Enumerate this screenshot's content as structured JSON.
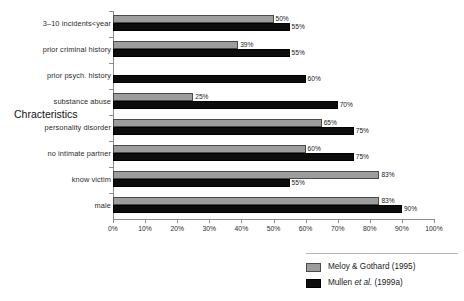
{
  "chart_data": {
    "type": "bar",
    "orientation": "horizontal",
    "title": "",
    "xlabel": "",
    "ylabel": "Chracteristics",
    "xlim": [
      0,
      100
    ],
    "grid": false,
    "legend_position": "bottom-right",
    "x_tick_labels": [
      "0%",
      "10%",
      "20%",
      "30%",
      "40%",
      "50%",
      "60%",
      "70%",
      "80%",
      "90%",
      "100%"
    ],
    "x_ticks": [
      0,
      10,
      20,
      30,
      40,
      50,
      60,
      70,
      80,
      90,
      100
    ],
    "categories": [
      "3–10  incidents<year",
      "prior criminal history",
      "prior psych. history",
      "substance abuse",
      "personality disorder",
      "no intimate partner",
      "know victim",
      "male"
    ],
    "series": [
      {
        "name": "Meloy & Gothard (1995)",
        "color": "#9d9d9d",
        "values": [
          50,
          39,
          null,
          25,
          65,
          60,
          83,
          83
        ],
        "value_labels": [
          "50%",
          "39%",
          "",
          "25%",
          "65%",
          "60%",
          "83%",
          "83%"
        ]
      },
      {
        "name": "Mullen et al. (1999a)",
        "color": "#0d0d0d",
        "values": [
          55,
          55,
          60,
          70,
          75,
          75,
          55,
          90
        ],
        "value_labels": [
          "55%",
          "55%",
          "60%",
          "70%",
          "75%",
          "75%",
          "55%",
          "90%"
        ]
      }
    ]
  },
  "legend": {
    "entries": [
      {
        "label_prefix": "Meloy & Gothard (1995)",
        "label_italic": "",
        "label_suffix": ""
      },
      {
        "label_prefix": "Mullen ",
        "label_italic": "et al.",
        "label_suffix": " (1999a)"
      }
    ]
  }
}
